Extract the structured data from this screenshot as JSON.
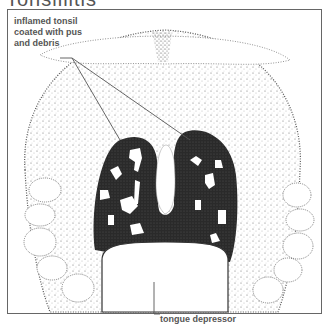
{
  "figure": {
    "title": "Tonsillitis",
    "labels": {
      "inflamed_tonsil": "inflamed tonsil coated with pus and debris",
      "tongue_depressor": "tongue depressor"
    },
    "colors": {
      "frame": "#666666",
      "stipple": "#333333",
      "tonsil_dark": "#2a2a2a",
      "label_text": "#555555"
    }
  }
}
